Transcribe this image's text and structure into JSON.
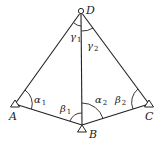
{
  "diagram": {
    "type": "survey-triangulation",
    "points": {
      "A": {
        "label": "A",
        "x": 15,
        "y": 104,
        "marker": "triangle"
      },
      "B": {
        "label": "B",
        "x": 82,
        "y": 125,
        "marker": "triangle"
      },
      "C": {
        "label": "C",
        "x": 149,
        "y": 104,
        "marker": "triangle"
      },
      "D": {
        "label": "D",
        "x": 81,
        "y": 11,
        "marker": "circle"
      }
    },
    "segments": [
      [
        "A",
        "D"
      ],
      [
        "D",
        "C"
      ],
      [
        "D",
        "B"
      ],
      [
        "A",
        "B"
      ],
      [
        "B",
        "C"
      ]
    ],
    "angles": {
      "alpha1": {
        "symbol": "α",
        "sub": "1"
      },
      "beta1": {
        "symbol": "β",
        "sub": "1"
      },
      "alpha2": {
        "symbol": "α",
        "sub": "2"
      },
      "beta2": {
        "symbol": "β",
        "sub": "2"
      },
      "gamma1": {
        "symbol": "γ",
        "sub": "1"
      },
      "gamma2": {
        "symbol": "γ",
        "sub": "2"
      }
    },
    "colors": {
      "line": "#222222",
      "background": "#ffffff"
    }
  }
}
